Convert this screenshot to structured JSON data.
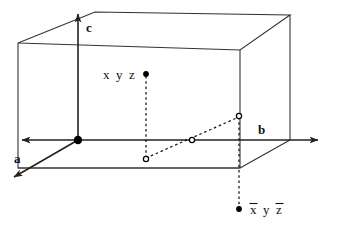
{
  "figure": {
    "type": "crystallographic-unit-cell-diagram",
    "background_color": "#ffffff",
    "line_color": "#222222",
    "marker_color": "#000000",
    "axes": [
      {
        "id": "a",
        "label": "a",
        "direction": "down-left",
        "arrow": true
      },
      {
        "id": "b",
        "label": "b",
        "direction": "right",
        "arrow": true
      },
      {
        "id": "c",
        "label": "c",
        "direction": "up",
        "arrow": true
      }
    ],
    "origin_label": "",
    "points": [
      {
        "id": "xyz",
        "label": "x y z",
        "label_plain": "x y z",
        "marker": "filled",
        "overbars": []
      },
      {
        "id": "xbar-y-zbar",
        "label": "x̄ y z̄",
        "label_plain": "-x y -z",
        "marker": "filled",
        "overbars": [
          "x",
          "z"
        ]
      }
    ],
    "projection_markers": [
      {
        "id": "proj-xyz-base",
        "marker": "open"
      },
      {
        "id": "inversion-center",
        "marker": "open"
      },
      {
        "id": "proj-xbaryzbar-base",
        "marker": "open"
      }
    ],
    "label_segments": {
      "xyz": [
        {
          "text": "x",
          "bar": false
        },
        {
          "text": "y",
          "bar": false
        },
        {
          "text": "z",
          "bar": false
        }
      ],
      "xbar_y_zbar": [
        {
          "text": "x",
          "bar": true
        },
        {
          "text": "y",
          "bar": false
        },
        {
          "text": "z",
          "bar": true
        }
      ]
    },
    "caption_sliver": "cut-off-caption-text"
  }
}
